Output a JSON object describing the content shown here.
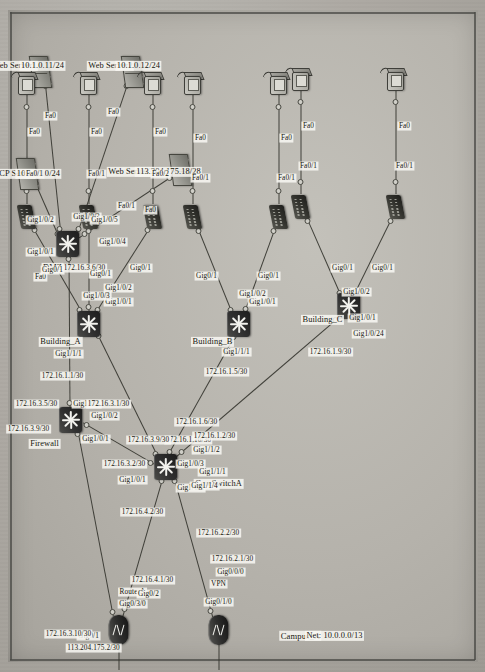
{
  "diagram": {
    "title": "Campus_A",
    "network_label": "Net: 10.0.0.0/13",
    "type": "network-topology"
  },
  "zones": {
    "dmz": "DMZ",
    "firewall": "Firewall",
    "building_a": "Building_A",
    "building_b": "Building_B",
    "building_c": "Building_C"
  },
  "devices": {
    "router_a": {
      "name": "RouterA",
      "wan_port": "Gig0/3/0"
    },
    "vpn": {
      "name": "VPN",
      "wan_port": "Gig0/1/0"
    },
    "core_switch": {
      "name": "CoreSwitchA"
    },
    "dmz_switch": {
      "name": "DMZ"
    },
    "firewall": {
      "name": "Firewall"
    }
  },
  "servers": [
    {
      "name": "Web Server1",
      "ip": "10.1.0.11/24",
      "port": "Fa0"
    },
    {
      "name": "Web Server2",
      "ip": "10.1.0.12/24",
      "port": "Fa0"
    },
    {
      "name": "Web Server3",
      "ip": "113.204.175.18/28",
      "port": "Fa0"
    },
    {
      "name": "DHCP Server",
      "ip": "10.1.0.10/24",
      "port": "Fa0"
    }
  ],
  "addresses": {
    "wan_router": "113.204.175.2/30",
    "router_to_fw": "172.16.3.10/30",
    "fw_to_router": "172.16.3.9/30",
    "fw_to_dmz": "172.16.3.5/30",
    "dmz_switch": "172.16.3.6/30",
    "fw_gig2": "172.16.3.1/30",
    "core_gig101": "172.16.3.2/30",
    "router_gig02": "172.16.4.1/30",
    "core_gig102": "172.16.4.2/30",
    "vpn_gig000": "172.16.2.1/30",
    "core_gig114": "172.16.2.2/30",
    "bldg_a_link": "172.16.1.1/30",
    "core_gig111": "172.16.1.2/30",
    "bldg_b_link": "172.16.1.5/30",
    "core_gig112": "172.16.1.6/30",
    "bldg_c_link": "172.16.1.9/30",
    "core_gig103": "172.16.1.10/30"
  },
  "ports": {
    "dmz": {
      "g1": "Gig1/0/1",
      "g2": "Gig1/0/2",
      "g3": "Gig1/0/3",
      "g4": "Gig1/0/4",
      "g5": "Gig1/0/5"
    },
    "firewall": {
      "g1": "Gig1/0/1",
      "g2": "Gig1/0/2",
      "g3": "Gig1/0/3"
    },
    "router": {
      "g1": "Gig0/1",
      "g2": "Gig0/2"
    },
    "vpn": {
      "g0": "Gig0/0/0"
    },
    "core": {
      "g101": "Gig1/0/1",
      "g102": "Gig1/0/2",
      "g103": "Gig1/0/3",
      "g111": "Gig1/1/1",
      "g112": "Gig1/1/2",
      "g114": "Gig1/1/4"
    },
    "bldg_a": {
      "uplink": "Gig1/1/1",
      "g101": "Gig1/0/1",
      "g102": "Gig1/0/2",
      "g103": "Gig1/0/3"
    },
    "bldg_b": {
      "uplink": "Gig1/1/1",
      "g101": "Gig1/0/1",
      "g102": "Gig1/0/2"
    },
    "bldg_c": {
      "uplink": "Gig1/0/24",
      "g101": "Gig1/0/1",
      "g102": "Gig1/0/2"
    },
    "access_uplink": "Gig0/1",
    "fa01": "Fa0/1",
    "fa02": "Fa0/2",
    "fa0": "Fa0"
  }
}
